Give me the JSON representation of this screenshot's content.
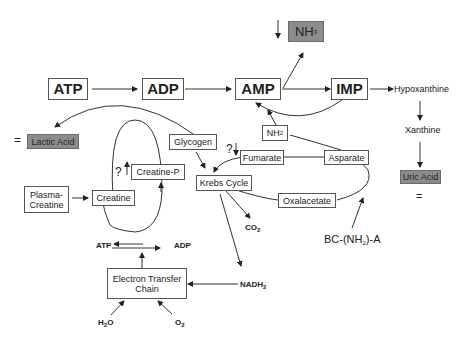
{
  "diagram": {
    "nodes": {
      "atp": "ATP",
      "adp": "ADP",
      "amp": "AMP",
      "imp": "IMP",
      "nh3": "NH",
      "nh3_sub": "3",
      "hypoxanthine": "Hypoxanthine",
      "xanthine": "Xanthine",
      "uric_acid": "Uric Acid",
      "uric_acid_eq": "=",
      "lactic_acid": "Lactic Acid",
      "lactic_acid_eq": "=",
      "glycogen": "Glycogen",
      "nh2": "NH",
      "nh2_sub": "2",
      "fumarate": "Fumarate",
      "asparate": "Asparate",
      "krebs_cycle": "Krebs Cycle",
      "oxalacetate": "Oxalacetate",
      "creatine_p": "Creatine-P",
      "creatine": "Creatine",
      "plasma_creatine_1": "Plasma-",
      "plasma_creatine_2": "Creatine",
      "co2": "CO",
      "co2_sub": "2",
      "bc_nh2_a_pre": "BC-(NH",
      "bc_nh2_a_sub": "2",
      "bc_nh2_a_post": ")-A",
      "atp_small": "ATP",
      "adp_small": "ADP",
      "etc_1": "Electron Transfer",
      "etc_2": "Chain",
      "nadh2": "NADH",
      "nadh2_sub": "2",
      "h2o_pre": "H",
      "h2o_sub": "2",
      "h2o_post": "O",
      "o2": "O",
      "o2_sub": "2",
      "question_creatine": "?",
      "question_fumarate": "?"
    },
    "colors": {
      "grey_box": "#8c8c8c",
      "line": "#333333"
    }
  }
}
